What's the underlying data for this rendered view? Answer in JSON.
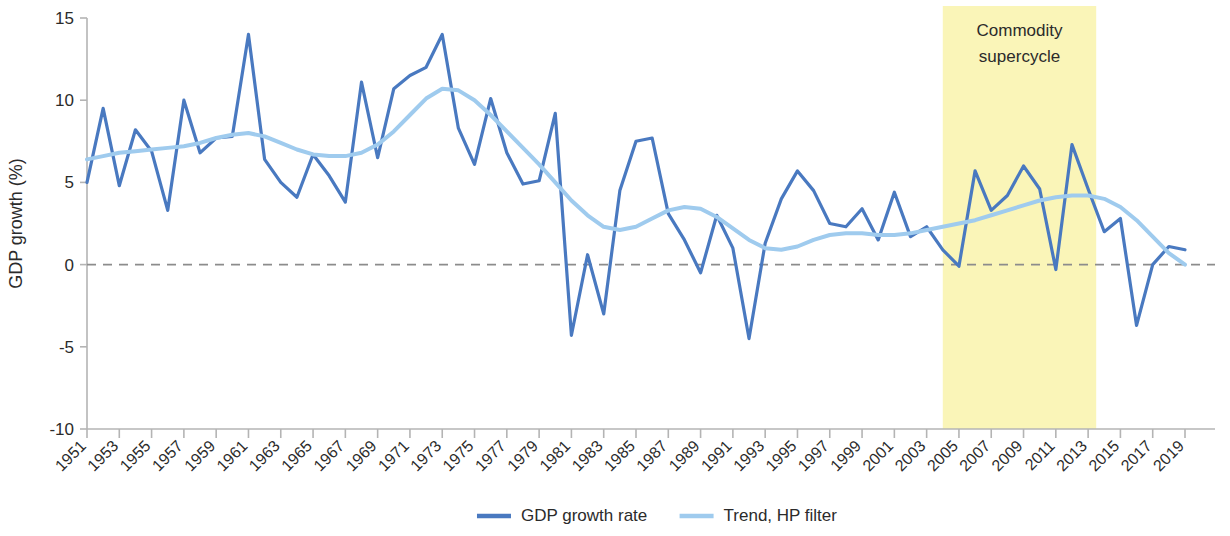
{
  "chart_data": {
    "type": "line",
    "title": "",
    "xlabel": "",
    "ylabel": "GDP growth (%)",
    "ylim": [
      -10,
      15
    ],
    "yticks": [
      15,
      10,
      5,
      0,
      -5,
      -10
    ],
    "ytick_labels": [
      "15",
      "10",
      "5",
      "0",
      "-5",
      "-10"
    ],
    "xlim": [
      1951,
      2019
    ],
    "xticks": [
      1951,
      1953,
      1955,
      1957,
      1959,
      1961,
      1963,
      1965,
      1967,
      1969,
      1971,
      1973,
      1975,
      1977,
      1979,
      1981,
      1983,
      1985,
      1987,
      1989,
      1991,
      1993,
      1995,
      1997,
      1999,
      2001,
      2003,
      2005,
      2007,
      2009,
      2011,
      2013,
      2015,
      2017,
      2019
    ],
    "xtick_labels": [
      "1951",
      "1953",
      "1955",
      "1957",
      "1959",
      "1961",
      "1963",
      "1965",
      "1967",
      "1969",
      "1971",
      "1973",
      "1975",
      "1977",
      "1979",
      "1981",
      "1983",
      "1985",
      "1987",
      "1989",
      "1991",
      "1993",
      "1995",
      "1997",
      "1999",
      "2001",
      "2003",
      "2005",
      "2007",
      "2009",
      "2011",
      "2013",
      "2015",
      "2017",
      "2019"
    ],
    "grid": false,
    "zero_line": true,
    "legend_position": "bottom",
    "x": [
      1951,
      1952,
      1953,
      1954,
      1955,
      1956,
      1957,
      1958,
      1959,
      1960,
      1961,
      1962,
      1963,
      1964,
      1965,
      1966,
      1967,
      1968,
      1969,
      1970,
      1971,
      1972,
      1973,
      1974,
      1975,
      1976,
      1977,
      1978,
      1979,
      1980,
      1981,
      1982,
      1983,
      1984,
      1985,
      1986,
      1987,
      1988,
      1989,
      1990,
      1991,
      1992,
      1993,
      1994,
      1995,
      1996,
      1997,
      1998,
      1999,
      2000,
      2001,
      2002,
      2003,
      2004,
      2005,
      2006,
      2007,
      2008,
      2009,
      2010,
      2011,
      2012,
      2013,
      2014,
      2015,
      2016,
      2017,
      2018,
      2019
    ],
    "series": [
      {
        "name": "GDP growth rate",
        "color": "#4979C0",
        "width": 3.2,
        "values": [
          5.0,
          9.5,
          4.8,
          8.2,
          6.9,
          3.3,
          10.0,
          6.8,
          7.7,
          7.8,
          14.0,
          6.4,
          5.0,
          4.1,
          6.7,
          5.4,
          3.8,
          11.1,
          6.5,
          10.7,
          11.5,
          12.0,
          14.0,
          8.3,
          6.1,
          10.1,
          6.8,
          4.9,
          5.1,
          9.2,
          -4.3,
          0.6,
          -3.0,
          4.5,
          7.5,
          7.7,
          3.1,
          1.5,
          -0.5,
          3.0,
          1.0,
          -4.5,
          1.3,
          4.0,
          5.7,
          4.5,
          2.5,
          2.3,
          3.4,
          1.5,
          4.4,
          1.7,
          2.3,
          0.9,
          -0.1,
          5.7,
          3.3,
          4.2,
          6.0,
          4.6,
          -0.3,
          7.3,
          4.6,
          2.0,
          2.8,
          -3.7,
          0.0,
          1.1,
          0.9
        ]
      },
      {
        "name": "Trend, HP filter",
        "color": "#9FCBEE",
        "width": 4.0,
        "values": [
          6.4,
          6.6,
          6.8,
          6.9,
          7.0,
          7.1,
          7.2,
          7.4,
          7.7,
          7.9,
          8.0,
          7.8,
          7.4,
          7.0,
          6.7,
          6.6,
          6.6,
          6.8,
          7.3,
          8.1,
          9.1,
          10.1,
          10.7,
          10.6,
          10.0,
          9.1,
          8.1,
          7.1,
          6.1,
          5.0,
          3.9,
          3.0,
          2.3,
          2.1,
          2.3,
          2.8,
          3.3,
          3.5,
          3.4,
          2.9,
          2.2,
          1.5,
          1.0,
          0.9,
          1.1,
          1.5,
          1.8,
          1.9,
          1.9,
          1.8,
          1.8,
          1.9,
          2.1,
          2.3,
          2.5,
          2.7,
          3.0,
          3.3,
          3.6,
          3.9,
          4.1,
          4.2,
          4.2,
          4.0,
          3.5,
          2.7,
          1.7,
          0.7,
          0.0
        ]
      }
    ],
    "annotations": [
      {
        "type": "vspan",
        "label_line1": "Commodity",
        "label_line2": "supercycle",
        "x_start": 2004,
        "x_end": 2013.5,
        "color": "#FAF5B8"
      }
    ],
    "legend": [
      {
        "label": "GDP growth rate",
        "color": "#4979C0"
      },
      {
        "label": "Trend, HP filter",
        "color": "#9FCBEE"
      }
    ]
  }
}
